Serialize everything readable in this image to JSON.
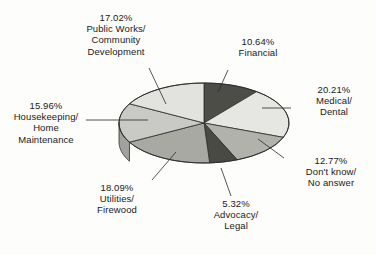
{
  "chart_data": {
    "type": "pie",
    "title": "",
    "subtitle": "",
    "xlabel": "",
    "ylabel": "",
    "legend_position": "none",
    "grid": false,
    "style": "3d-pie-grayscale",
    "start_angle_deg": 0,
    "direction": "clockwise",
    "categories": [
      "Financial",
      "Medical/\nDental",
      "Don't know/\nNo answer",
      "Advocacy/\nLegal",
      "Utilities/\nFirewood",
      "Housekeeping/\nHome\nMaintenance",
      "Public Works/\nCommunity\nDevelopment"
    ],
    "values": [
      10.64,
      20.21,
      12.77,
      5.32,
      18.09,
      15.96,
      17.02
    ],
    "value_labels": [
      "10.64%",
      "20.21%",
      "12.77%",
      "5.32%",
      "18.09%",
      "15.96%",
      "17.02%"
    ],
    "slice_colors": [
      "#4d4d47",
      "#e6e6e2",
      "#b2b2ad",
      "#4a4a44",
      "#a9a9a4",
      "#c9c9c5",
      "#e2e2de"
    ],
    "slices": [
      {
        "id": "financial",
        "percent_label": "10.64%",
        "name": "Financial",
        "value": 10.64,
        "color": "#4d4d47"
      },
      {
        "id": "medical-dental",
        "percent_label": "20.21%",
        "name": "Medical/\nDental",
        "value": 20.21,
        "color": "#e6e6e2"
      },
      {
        "id": "dont-know",
        "percent_label": "12.77%",
        "name": "Don't know/\nNo answer",
        "value": 12.77,
        "color": "#b2b2ad"
      },
      {
        "id": "advocacy-legal",
        "percent_label": "5.32%",
        "name": "Advocacy/\nLegal",
        "value": 5.32,
        "color": "#4a4a44"
      },
      {
        "id": "utilities-firewood",
        "percent_label": "18.09%",
        "name": "Utilities/\nFirewood",
        "value": 18.09,
        "color": "#a9a9a4"
      },
      {
        "id": "housekeeping",
        "percent_label": "15.96%",
        "name": "Housekeeping/\nHome\nMaintenance",
        "value": 15.96,
        "color": "#c9c9c5"
      },
      {
        "id": "public-works",
        "percent_label": "17.02%",
        "name": "Public Works/\nCommunity\nDevelopment",
        "value": 17.02,
        "color": "#e2e2de"
      }
    ]
  },
  "labels": {
    "public_works": "17.02%\nPublic Works/\nCommunity\nDevelopment",
    "financial": "10.64%\nFinancial",
    "medical_dental": "20.21%\nMedical/\nDental",
    "dont_know": "12.77%\nDon't know/\nNo answer",
    "advocacy_legal": "5.32%\nAdvocacy/\nLegal",
    "utilities_firewood": "18.09%\nUtilities/\nFirewood",
    "housekeeping": "15.96%\nHousekeeping/\nHome\nMaintenance"
  }
}
